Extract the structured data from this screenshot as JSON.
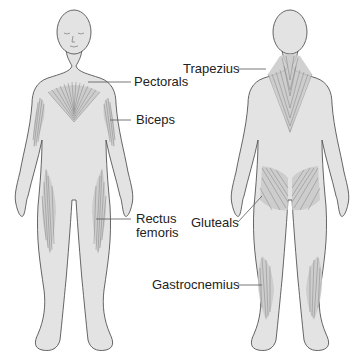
{
  "diagram": {
    "views": [
      {
        "id": "front",
        "description": "Anterior view of human figure"
      },
      {
        "id": "back",
        "description": "Posterior view of human figure"
      }
    ],
    "labels": {
      "pectorals": "Pectorals",
      "biceps": "Biceps",
      "rectus_line1": "Rectus",
      "rectus_line2": "femoris",
      "trapezius": "Trapezius",
      "gluteals": "Gluteals",
      "gastrocnemius": "Gastrocnemius"
    },
    "colors": {
      "body_fill": "#e3e3e3",
      "outline": "#555555",
      "muscle_shade": "#c9c9c9",
      "background": "#ffffff"
    }
  }
}
